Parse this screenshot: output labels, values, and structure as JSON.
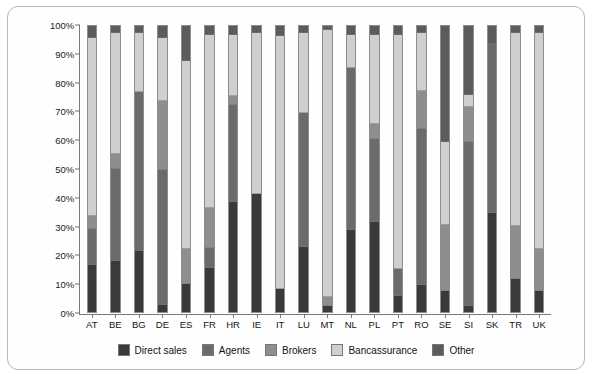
{
  "chart_data": {
    "type": "bar",
    "stacked": true,
    "normalized_percent": true,
    "title": "",
    "xlabel": "",
    "ylabel": "",
    "ylim": [
      0,
      100
    ],
    "yticks": [
      "0%",
      "10%",
      "20%",
      "30%",
      "40%",
      "50%",
      "60%",
      "70%",
      "80%",
      "90%",
      "100%"
    ],
    "ytick_values": [
      0,
      10,
      20,
      30,
      40,
      50,
      60,
      70,
      80,
      90,
      100
    ],
    "grid": false,
    "legend_position": "bottom",
    "categories": [
      "AT",
      "BE",
      "BG",
      "DE",
      "ES",
      "FR",
      "HR",
      "IE",
      "IT",
      "LU",
      "MT",
      "NL",
      "PL",
      "PT",
      "RO",
      "SE",
      "SI",
      "SK",
      "TR",
      "UK"
    ],
    "series": [
      {
        "name": "Direct sales",
        "color": "#3a3a3a",
        "values": [
          16.5,
          18.0,
          21.5,
          2.5,
          10.0,
          15.5,
          39.0,
          41.5,
          8.0,
          23.0,
          2.0,
          29.0,
          32.0,
          5.5,
          9.5,
          7.5,
          2.0,
          35.0,
          11.5,
          7.5
        ]
      },
      {
        "name": "Agents",
        "color": "#6b6b6b",
        "values": [
          12.5,
          32.5,
          56.0,
          47.5,
          0.0,
          7.0,
          34.0,
          0.0,
          0.0,
          47.0,
          0.0,
          57.0,
          29.0,
          9.5,
          55.0,
          0.0,
          58.0,
          59.0,
          0.0,
          0.0
        ]
      },
      {
        "name": "Brokers",
        "color": "#8e8e8e",
        "values": [
          4.5,
          5.0,
          0.0,
          24.0,
          12.0,
          13.5,
          3.0,
          0.0,
          0.0,
          0.0,
          3.0,
          0.0,
          5.0,
          0.0,
          13.0,
          23.0,
          12.0,
          0.0,
          18.5,
          14.5
        ]
      },
      {
        "name": "Bancassurance",
        "color": "#cfcfcf",
        "values": [
          62.5,
          42.5,
          20.5,
          22.0,
          66.0,
          61.0,
          21.0,
          56.5,
          89.0,
          28.0,
          94.0,
          11.0,
          31.0,
          82.0,
          20.5,
          29.0,
          4.0,
          0.0,
          68.0,
          76.0
        ]
      },
      {
        "name": "Other",
        "color": "#5c5c5c",
        "values": [
          4.0,
          2.0,
          2.0,
          4.0,
          12.0,
          3.0,
          3.0,
          2.0,
          3.0,
          2.0,
          1.0,
          3.0,
          3.0,
          3.0,
          2.0,
          40.5,
          24.0,
          6.0,
          2.0,
          2.0
        ]
      }
    ]
  },
  "legend": {
    "items": [
      {
        "label": "Direct sales",
        "color": "#3a3a3a"
      },
      {
        "label": "Agents",
        "color": "#6b6b6b"
      },
      {
        "label": "Brokers",
        "color": "#8e8e8e"
      },
      {
        "label": "Bancassurance",
        "color": "#cfcfcf"
      },
      {
        "label": "Other",
        "color": "#5c5c5c"
      }
    ]
  },
  "colors": {
    "axis": "#7a7a7a",
    "text": "#141414",
    "border": "#b9b9b9",
    "background": "#fefefe"
  }
}
